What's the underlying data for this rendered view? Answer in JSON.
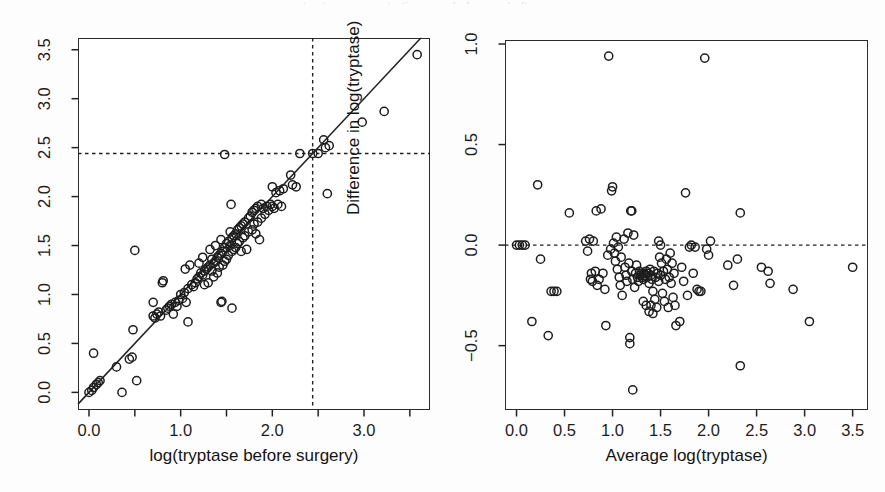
{
  "figure": {
    "background": "#fdfdfd",
    "ink": "#1d1d1d",
    "cutoff_header_text": "tryptase concentration p   g     , before and after surgery",
    "marker": "open-circle"
  },
  "chart_data": [
    {
      "type": "scatter",
      "panel": "left",
      "title": "",
      "xlabel": "log(tryptase before surgery)",
      "ylabel": "log(tryptase after surgery)",
      "xlim": [
        -0.12,
        3.72
      ],
      "ylim": [
        -0.18,
        3.62
      ],
      "xticks": [
        0.0,
        0.5,
        1.0,
        1.5,
        2.0,
        2.5,
        3.0,
        3.5
      ],
      "xticklabels": [
        "0.0",
        "",
        "1.0",
        "",
        "2.0",
        "",
        "3.0",
        ""
      ],
      "yticks": [
        0.0,
        0.5,
        1.0,
        1.5,
        2.0,
        2.5,
        3.0,
        3.5
      ],
      "yticklabels": [
        "0.0",
        "0.5",
        "1.0",
        "1.5",
        "2.0",
        "2.5",
        "3.0",
        "3.5"
      ],
      "grid": false,
      "legend": "none",
      "reference_lines": [
        {
          "kind": "identity",
          "style": "solid",
          "slope": 1,
          "intercept": 0
        },
        {
          "kind": "vertical",
          "style": "dashed",
          "x": 2.44
        },
        {
          "kind": "horizontal",
          "style": "dashed",
          "y": 2.44
        }
      ],
      "points": [
        [
          0.0,
          0.0
        ],
        [
          0.03,
          0.02
        ],
        [
          0.05,
          0.05
        ],
        [
          0.05,
          0.4
        ],
        [
          0.08,
          0.08
        ],
        [
          0.1,
          0.1
        ],
        [
          0.12,
          0.12
        ],
        [
          0.3,
          0.26
        ],
        [
          0.36,
          0.0
        ],
        [
          0.44,
          0.34
        ],
        [
          0.47,
          0.36
        ],
        [
          0.48,
          0.64
        ],
        [
          0.5,
          1.45
        ],
        [
          0.52,
          0.12
        ],
        [
          0.7,
          0.78
        ],
        [
          0.7,
          0.92
        ],
        [
          0.72,
          0.76
        ],
        [
          0.74,
          0.8
        ],
        [
          0.76,
          0.82
        ],
        [
          0.78,
          0.78
        ],
        [
          0.8,
          1.12
        ],
        [
          0.81,
          1.14
        ],
        [
          0.84,
          0.84
        ],
        [
          0.86,
          0.86
        ],
        [
          0.88,
          0.88
        ],
        [
          0.9,
          0.9
        ],
        [
          0.92,
          0.8
        ],
        [
          0.94,
          0.92
        ],
        [
          0.96,
          0.88
        ],
        [
          0.98,
          0.94
        ],
        [
          1.0,
          1.0
        ],
        [
          1.02,
          0.96
        ],
        [
          1.04,
          1.02
        ],
        [
          1.05,
          1.26
        ],
        [
          1.06,
          0.92
        ],
        [
          1.08,
          1.06
        ],
        [
          1.08,
          0.72
        ],
        [
          1.1,
          1.3
        ],
        [
          1.12,
          1.1
        ],
        [
          1.14,
          1.08
        ],
        [
          1.16,
          1.12
        ],
        [
          1.18,
          1.16
        ],
        [
          1.2,
          1.18
        ],
        [
          1.2,
          1.32
        ],
        [
          1.22,
          1.22
        ],
        [
          1.24,
          1.2
        ],
        [
          1.24,
          1.38
        ],
        [
          1.26,
          1.24
        ],
        [
          1.26,
          1.1
        ],
        [
          1.28,
          1.26
        ],
        [
          1.3,
          1.28
        ],
        [
          1.3,
          1.12
        ],
        [
          1.32,
          1.3
        ],
        [
          1.32,
          1.46
        ],
        [
          1.34,
          1.24
        ],
        [
          1.34,
          1.36
        ],
        [
          1.36,
          1.32
        ],
        [
          1.36,
          1.18
        ],
        [
          1.38,
          1.34
        ],
        [
          1.38,
          1.5
        ],
        [
          1.4,
          1.38
        ],
        [
          1.4,
          1.22
        ],
        [
          1.42,
          1.4
        ],
        [
          1.42,
          1.28
        ],
        [
          1.44,
          1.42
        ],
        [
          1.44,
          1.56
        ],
        [
          1.44,
          0.92
        ],
        [
          1.45,
          0.93
        ],
        [
          1.46,
          1.3
        ],
        [
          1.46,
          1.44
        ],
        [
          1.48,
          1.48
        ],
        [
          1.48,
          1.34
        ],
        [
          1.48,
          2.43
        ],
        [
          1.5,
          1.52
        ],
        [
          1.5,
          1.36
        ],
        [
          1.52,
          1.54
        ],
        [
          1.52,
          1.4
        ],
        [
          1.54,
          1.5
        ],
        [
          1.54,
          1.64
        ],
        [
          1.55,
          1.92
        ],
        [
          1.56,
          1.58
        ],
        [
          1.56,
          1.44
        ],
        [
          1.56,
          0.86
        ],
        [
          1.58,
          1.6
        ],
        [
          1.58,
          1.46
        ],
        [
          1.6,
          1.62
        ],
        [
          1.6,
          1.48
        ],
        [
          1.62,
          1.66
        ],
        [
          1.62,
          1.52
        ],
        [
          1.64,
          1.68
        ],
        [
          1.64,
          1.54
        ],
        [
          1.66,
          1.44
        ],
        [
          1.66,
          1.7
        ],
        [
          1.68,
          1.72
        ],
        [
          1.68,
          1.58
        ],
        [
          1.7,
          1.74
        ],
        [
          1.7,
          1.6
        ],
        [
          1.72,
          1.46
        ],
        [
          1.74,
          1.78
        ],
        [
          1.74,
          1.64
        ],
        [
          1.76,
          1.8
        ],
        [
          1.78,
          1.66
        ],
        [
          1.78,
          1.84
        ],
        [
          1.8,
          1.86
        ],
        [
          1.8,
          1.72
        ],
        [
          1.82,
          1.62
        ],
        [
          1.82,
          1.88
        ],
        [
          1.84,
          1.9
        ],
        [
          1.84,
          1.74
        ],
        [
          1.86,
          1.56
        ],
        [
          1.88,
          1.78
        ],
        [
          1.88,
          1.92
        ],
        [
          1.9,
          1.88
        ],
        [
          1.92,
          1.82
        ],
        [
          1.94,
          1.9
        ],
        [
          1.96,
          1.86
        ],
        [
          1.98,
          1.92
        ],
        [
          2.0,
          2.1
        ],
        [
          2.0,
          1.9
        ],
        [
          2.02,
          1.88
        ],
        [
          2.04,
          2.04
        ],
        [
          2.06,
          1.92
        ],
        [
          2.08,
          2.06
        ],
        [
          2.1,
          1.9
        ],
        [
          2.12,
          2.08
        ],
        [
          2.2,
          2.22
        ],
        [
          2.22,
          2.12
        ],
        [
          2.26,
          2.1
        ],
        [
          2.3,
          2.44
        ],
        [
          2.44,
          2.44
        ],
        [
          2.5,
          2.44
        ],
        [
          2.56,
          2.58
        ],
        [
          2.58,
          2.5
        ],
        [
          2.6,
          2.03
        ],
        [
          2.62,
          2.52
        ],
        [
          2.98,
          2.76
        ],
        [
          3.22,
          2.87
        ],
        [
          3.58,
          3.45
        ]
      ]
    },
    {
      "type": "scatter",
      "panel": "right",
      "title": "",
      "xlabel": "Average log(tryptase)",
      "ylabel": "Difference in log(tryptase)",
      "xlim": [
        -0.12,
        3.66
      ],
      "ylim": [
        -0.82,
        1.02
      ],
      "xticks": [
        0.0,
        0.5,
        1.0,
        1.5,
        2.0,
        2.5,
        3.0,
        3.5
      ],
      "xticklabels": [
        "0.0",
        "0.5",
        "1.0",
        "1.5",
        "2.0",
        "2.5",
        "3.0",
        "3.5"
      ],
      "yticks": [
        -0.5,
        0.0,
        0.5,
        1.0
      ],
      "yticklabels": [
        "-0.5",
        "0.0",
        "0.5",
        "1.0"
      ],
      "grid": false,
      "legend": "none",
      "reference_lines": [
        {
          "kind": "horizontal",
          "style": "dashed",
          "y": 0.0
        }
      ],
      "points": [
        [
          0.0,
          0.0
        ],
        [
          0.03,
          0.0
        ],
        [
          0.06,
          0.0
        ],
        [
          0.09,
          0.0
        ],
        [
          0.16,
          -0.38
        ],
        [
          0.22,
          0.3
        ],
        [
          0.25,
          -0.07
        ],
        [
          0.33,
          -0.45
        ],
        [
          0.36,
          -0.23
        ],
        [
          0.39,
          -0.23
        ],
        [
          0.42,
          -0.23
        ],
        [
          0.55,
          0.16
        ],
        [
          0.72,
          0.02
        ],
        [
          0.74,
          -0.03
        ],
        [
          0.76,
          0.03
        ],
        [
          0.77,
          -0.17
        ],
        [
          0.78,
          -0.14
        ],
        [
          0.79,
          -0.18
        ],
        [
          0.8,
          0.02
        ],
        [
          0.82,
          -0.13
        ],
        [
          0.83,
          0.17
        ],
        [
          0.84,
          -0.2
        ],
        [
          0.86,
          -0.17
        ],
        [
          0.88,
          0.18
        ],
        [
          0.9,
          -0.14
        ],
        [
          0.92,
          -0.22
        ],
        [
          0.93,
          -0.4
        ],
        [
          0.95,
          -0.05
        ],
        [
          0.96,
          0.94
        ],
        [
          0.98,
          -0.02
        ],
        [
          0.99,
          0.27
        ],
        [
          1.0,
          0.29
        ],
        [
          1.01,
          0.01
        ],
        [
          1.02,
          -0.04
        ],
        [
          1.03,
          -0.08
        ],
        [
          1.04,
          0.04
        ],
        [
          1.05,
          -0.12
        ],
        [
          1.06,
          -0.01
        ],
        [
          1.07,
          -0.16
        ],
        [
          1.08,
          -0.2
        ],
        [
          1.09,
          -0.06
        ],
        [
          1.1,
          -0.25
        ],
        [
          1.12,
          0.03
        ],
        [
          1.13,
          -0.11
        ],
        [
          1.14,
          -0.15
        ],
        [
          1.15,
          -0.18
        ],
        [
          1.16,
          0.06
        ],
        [
          1.17,
          -0.09
        ],
        [
          1.18,
          -0.46
        ],
        [
          1.18,
          -0.49
        ],
        [
          1.19,
          0.17
        ],
        [
          1.2,
          0.17
        ],
        [
          1.2,
          -0.13
        ],
        [
          1.21,
          -0.17
        ],
        [
          1.21,
          -0.72
        ],
        [
          1.22,
          0.05
        ],
        [
          1.23,
          -0.21
        ],
        [
          1.24,
          -0.14
        ],
        [
          1.25,
          -0.1
        ],
        [
          1.26,
          -0.16
        ],
        [
          1.27,
          -0.18
        ],
        [
          1.28,
          -0.13
        ],
        [
          1.29,
          -0.15
        ],
        [
          1.3,
          -0.14
        ],
        [
          1.31,
          -0.16
        ],
        [
          1.32,
          -0.17
        ],
        [
          1.32,
          -0.28
        ],
        [
          1.33,
          -0.14
        ],
        [
          1.34,
          -0.15
        ],
        [
          1.35,
          -0.13
        ],
        [
          1.35,
          -0.3
        ],
        [
          1.36,
          -0.16
        ],
        [
          1.37,
          -0.14
        ],
        [
          1.38,
          -0.19
        ],
        [
          1.38,
          -0.33
        ],
        [
          1.39,
          -0.12
        ],
        [
          1.4,
          -0.15
        ],
        [
          1.4,
          -0.3
        ],
        [
          1.41,
          -0.17
        ],
        [
          1.42,
          -0.23
        ],
        [
          1.42,
          -0.34
        ],
        [
          1.43,
          -0.13
        ],
        [
          1.44,
          -0.27
        ],
        [
          1.45,
          -0.16
        ],
        [
          1.46,
          -0.31
        ],
        [
          1.47,
          -0.14
        ],
        [
          1.48,
          0.02
        ],
        [
          1.48,
          -0.18
        ],
        [
          1.49,
          -0.06
        ],
        [
          1.5,
          0.0
        ],
        [
          1.5,
          -0.15
        ],
        [
          1.51,
          -0.09
        ],
        [
          1.52,
          -0.24
        ],
        [
          1.53,
          -0.13
        ],
        [
          1.54,
          -0.28
        ],
        [
          1.55,
          -0.17
        ],
        [
          1.56,
          -0.07
        ],
        [
          1.57,
          -0.12
        ],
        [
          1.58,
          -0.31
        ],
        [
          1.59,
          -0.16
        ],
        [
          1.6,
          -0.04
        ],
        [
          1.61,
          -0.19
        ],
        [
          1.62,
          -0.09
        ],
        [
          1.63,
          -0.26
        ],
        [
          1.64,
          -0.14
        ],
        [
          1.65,
          -0.3
        ],
        [
          1.66,
          -0.4
        ],
        [
          1.7,
          -0.38
        ],
        [
          1.72,
          -0.11
        ],
        [
          1.74,
          -0.18
        ],
        [
          1.76,
          0.26
        ],
        [
          1.78,
          -0.25
        ],
        [
          1.8,
          -0.01
        ],
        [
          1.82,
          0.0
        ],
        [
          1.84,
          -0.14
        ],
        [
          1.86,
          -0.01
        ],
        [
          1.88,
          -0.22
        ],
        [
          1.9,
          -0.23
        ],
        [
          1.92,
          -0.23
        ],
        [
          1.96,
          0.93
        ],
        [
          1.98,
          -0.02
        ],
        [
          2.0,
          -0.05
        ],
        [
          2.02,
          0.02
        ],
        [
          2.2,
          -0.1
        ],
        [
          2.26,
          -0.2
        ],
        [
          2.3,
          -0.07
        ],
        [
          2.33,
          0.16
        ],
        [
          2.33,
          -0.6
        ],
        [
          2.55,
          -0.11
        ],
        [
          2.62,
          -0.13
        ],
        [
          2.64,
          -0.19
        ],
        [
          2.88,
          -0.22
        ],
        [
          3.05,
          -0.38
        ],
        [
          3.5,
          -0.11
        ]
      ]
    }
  ]
}
